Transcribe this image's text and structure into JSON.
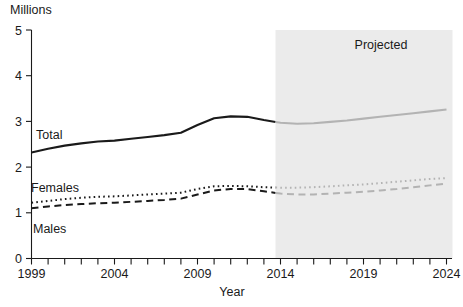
{
  "chart_data": {
    "type": "line",
    "title": "",
    "xlabel": "Year",
    "ylabel": "Millions",
    "ylabel_position": "top-left",
    "xlim": [
      1999,
      2024
    ],
    "ylim": [
      0,
      5
    ],
    "y_ticks": [
      "5",
      "4",
      "3",
      "2",
      "1",
      "0"
    ],
    "y_tick_values": [
      5,
      4,
      3,
      2,
      1,
      0
    ],
    "x_ticks_labeled": [
      "1999",
      "2004",
      "2009",
      "2014",
      "2019",
      "2024"
    ],
    "x_tick_values_labeled": [
      1999,
      2004,
      2009,
      2014,
      2019,
      2024
    ],
    "x_tick_interval": 1,
    "grid": false,
    "legend": "inline-labels",
    "annotations": [
      {
        "text": "Projected",
        "type": "shaded-region-label",
        "region_start": 2013.7,
        "region_end": 2024,
        "region_color": "#ebebeb"
      }
    ],
    "x": [
      1999,
      2000,
      2001,
      2002,
      2003,
      2004,
      2005,
      2006,
      2007,
      2008,
      2009,
      2010,
      2011,
      2012,
      2013,
      2014,
      2015,
      2016,
      2017,
      2018,
      2019,
      2020,
      2021,
      2022,
      2023,
      2024
    ],
    "projection_start_year": 2013.7,
    "series": [
      {
        "name": "Total",
        "style": "solid",
        "color": "#1a1a1a",
        "projected_color": "#b3b3b3",
        "values": [
          2.32,
          2.4,
          2.47,
          2.52,
          2.56,
          2.58,
          2.62,
          2.66,
          2.7,
          2.75,
          2.92,
          3.07,
          3.11,
          3.1,
          3.03,
          2.97,
          2.95,
          2.96,
          2.99,
          3.02,
          3.06,
          3.1,
          3.14,
          3.18,
          3.22,
          3.26
        ]
      },
      {
        "name": "Females",
        "style": "dotted",
        "color": "#1a1a1a",
        "projected_color": "#b3b3b3",
        "values": [
          1.22,
          1.26,
          1.3,
          1.33,
          1.35,
          1.36,
          1.38,
          1.4,
          1.42,
          1.44,
          1.52,
          1.58,
          1.59,
          1.58,
          1.56,
          1.55,
          1.55,
          1.56,
          1.58,
          1.6,
          1.62,
          1.65,
          1.68,
          1.71,
          1.74,
          1.76
        ]
      },
      {
        "name": "Males",
        "style": "dashed",
        "color": "#1a1a1a",
        "projected_color": "#b3b3b3",
        "values": [
          1.1,
          1.14,
          1.17,
          1.19,
          1.21,
          1.22,
          1.24,
          1.26,
          1.28,
          1.31,
          1.4,
          1.49,
          1.52,
          1.52,
          1.47,
          1.42,
          1.4,
          1.4,
          1.42,
          1.44,
          1.46,
          1.49,
          1.52,
          1.56,
          1.6,
          1.64
        ]
      }
    ]
  },
  "labels": {
    "y_unit": "Millions",
    "x_axis_title": "Year",
    "projected": "Projected",
    "series_total": "Total",
    "series_females": "Females",
    "series_males": "Males"
  },
  "colors": {
    "ink": "#1a1a1a",
    "projected_band": "#ebebeb",
    "projected_line": "#b3b3b3",
    "background": "#ffffff"
  }
}
